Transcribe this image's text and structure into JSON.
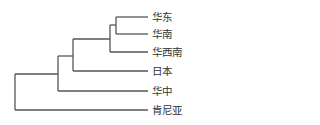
{
  "diagram": {
    "type": "dendrogram",
    "line_color": "#555555",
    "leaves": [
      {
        "label": "华东",
        "y": 17
      },
      {
        "label": "华南",
        "y": 34
      },
      {
        "label": "华西南",
        "y": 52
      },
      {
        "label": "日本",
        "y": 71
      },
      {
        "label": "华中",
        "y": 90
      },
      {
        "label": "肯尼亚",
        "y": 109
      }
    ]
  }
}
